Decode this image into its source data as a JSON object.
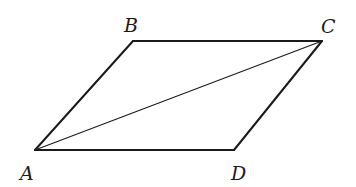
{
  "diagram": {
    "type": "parallelogram-with-diagonal",
    "vertices": [
      {
        "name": "A",
        "label": "A",
        "x": 35,
        "y": 150,
        "label_x": 20,
        "label_y": 180
      },
      {
        "name": "B",
        "label": "B",
        "x": 133,
        "y": 41,
        "label_x": 124,
        "label_y": 32
      },
      {
        "name": "C",
        "label": "C",
        "x": 322,
        "y": 41,
        "label_x": 321,
        "label_y": 33
      },
      {
        "name": "D",
        "label": "D",
        "x": 234,
        "y": 150,
        "label_x": 231,
        "label_y": 180
      }
    ],
    "edges": [
      {
        "from": "A",
        "to": "B",
        "kind": "side"
      },
      {
        "from": "B",
        "to": "C",
        "kind": "side"
      },
      {
        "from": "C",
        "to": "D",
        "kind": "side"
      },
      {
        "from": "D",
        "to": "A",
        "kind": "side"
      },
      {
        "from": "A",
        "to": "C",
        "kind": "diagonal"
      }
    ],
    "colors": {
      "stroke": "#1a1a1a",
      "background": "#ffffff"
    }
  }
}
